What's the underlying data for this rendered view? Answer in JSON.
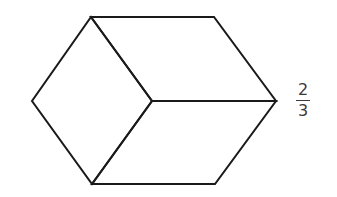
{
  "diagram": {
    "type": "hexagon-cube-fraction",
    "stroke_color": "#1a1a1a",
    "stroke_width": 2,
    "vertices": {
      "top_left": [
        91,
        17
      ],
      "top_right": [
        214,
        17
      ],
      "right": [
        276,
        101
      ],
      "bottom_right": [
        215,
        184
      ],
      "bottom_left": [
        92,
        184
      ],
      "left": [
        32,
        101
      ],
      "center": [
        152,
        101
      ]
    },
    "shapes": [
      {
        "name": "left-rhombus",
        "points": "91,17 152,101 92,184 32,101"
      },
      {
        "name": "top-right-rhombus",
        "points": "91,17 214,17 276,101 152,101"
      },
      {
        "name": "bottom-right-rhombus",
        "points": "152,101 276,101 215,184 92,184"
      }
    ]
  },
  "label": {
    "numerator": "2",
    "denominator": "3",
    "text_color": "#3a3a3a"
  }
}
